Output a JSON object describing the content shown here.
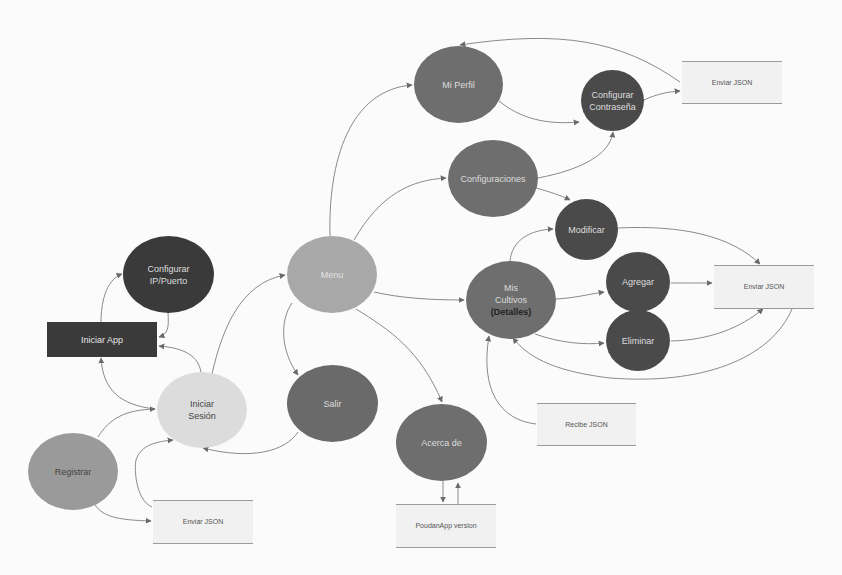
{
  "diagram": {
    "type": "navigation flow diagram",
    "colors": {
      "background": "#fbfbfb",
      "dark": "#3a3a3a",
      "medium_dark": "#555555",
      "medium": "#6e6e6e",
      "light_medium": "#9c9c9c",
      "light": "#d9d9d9",
      "store_fill": "#f1f1f1",
      "edge": "#8a8a8a"
    },
    "nodes": [
      {
        "id": "iniciar_app",
        "label": "Iniciar App",
        "shape": "rect",
        "x": 47,
        "y": 322,
        "w": 110,
        "h": 35,
        "fill": "#3a3a3a",
        "text": "#e8e8e8"
      },
      {
        "id": "configurar_ip",
        "label": "Configurar\nIP/Puerto",
        "shape": "ellipse",
        "x": 123,
        "y": 236,
        "w": 91,
        "h": 77,
        "fill": "#3a3a3a",
        "text": "#dddddd"
      },
      {
        "id": "menu",
        "label": "Menu",
        "shape": "ellipse",
        "x": 287,
        "y": 236,
        "w": 90,
        "h": 77,
        "fill": "#a8a8a8",
        "text": "#e4e4e4"
      },
      {
        "id": "iniciar_sesion",
        "label": "Iniciar\nSesión",
        "shape": "ellipse",
        "x": 157,
        "y": 372,
        "w": 90,
        "h": 76,
        "fill": "#dcdcdc",
        "text": "#444444"
      },
      {
        "id": "registrar",
        "label": "Registrar",
        "shape": "ellipse",
        "x": 28,
        "y": 433,
        "w": 90,
        "h": 77,
        "fill": "#9a9a9a",
        "text": "#444444"
      },
      {
        "id": "salir",
        "label": "Salir",
        "shape": "ellipse",
        "x": 287,
        "y": 365,
        "w": 91,
        "h": 77,
        "fill": "#6a6a6a",
        "text": "#dddddd"
      },
      {
        "id": "mi_perfil",
        "label": "Mi Perfil",
        "shape": "ellipse",
        "x": 414,
        "y": 46,
        "w": 89,
        "h": 77,
        "fill": "#6e6e6e",
        "text": "#dddddd"
      },
      {
        "id": "configurar_contrasena",
        "label": "Configurar\nContraseña",
        "shape": "ellipse",
        "x": 581,
        "y": 70,
        "w": 63,
        "h": 61,
        "fill": "#4a4a4a",
        "text": "#dddddd"
      },
      {
        "id": "configuraciones",
        "label": "Configuraciones",
        "shape": "ellipse",
        "x": 448,
        "y": 140,
        "w": 90,
        "h": 77,
        "fill": "#6e6e6e",
        "text": "#dddddd"
      },
      {
        "id": "modificar",
        "label": "Modificar",
        "shape": "ellipse",
        "x": 555,
        "y": 199,
        "w": 63,
        "h": 61,
        "fill": "#4a4a4a",
        "text": "#dddddd"
      },
      {
        "id": "mis_cultivos",
        "label": "Mis\nCultivos",
        "sublabel": "(Detalles)",
        "shape": "ellipse",
        "x": 466,
        "y": 261,
        "w": 90,
        "h": 78,
        "fill": "#6e6e6e",
        "text": "#dddddd"
      },
      {
        "id": "agregar",
        "label": "Agregar",
        "shape": "ellipse",
        "x": 606,
        "y": 252,
        "w": 64,
        "h": 60,
        "fill": "#4a4a4a",
        "text": "#dddddd"
      },
      {
        "id": "eliminar",
        "label": "Eliminar",
        "shape": "ellipse",
        "x": 606,
        "y": 310,
        "w": 64,
        "h": 61,
        "fill": "#4a4a4a",
        "text": "#dddddd"
      },
      {
        "id": "acerca_de",
        "label": "Acerca de",
        "shape": "ellipse",
        "x": 396,
        "y": 404,
        "w": 91,
        "h": 77,
        "fill": "#6e6e6e",
        "text": "#dddddd"
      },
      {
        "id": "enviar_json_top",
        "label": "Enviar JSON",
        "shape": "store",
        "x": 682,
        "y": 61,
        "w": 100,
        "h": 43
      },
      {
        "id": "enviar_json_right",
        "label": "Enviar JSON",
        "shape": "store",
        "x": 714,
        "y": 265,
        "w": 100,
        "h": 44
      },
      {
        "id": "recibe_json",
        "label": "Recibe JSON",
        "shape": "store",
        "x": 537,
        "y": 403,
        "w": 99,
        "h": 43
      },
      {
        "id": "enviar_json_bottom",
        "label": "Enviar JSON",
        "shape": "store",
        "x": 153,
        "y": 500,
        "w": 100,
        "h": 44
      },
      {
        "id": "poudan_version",
        "label": "PoudanApp version",
        "shape": "store",
        "x": 396,
        "y": 504,
        "w": 100,
        "h": 44
      }
    ],
    "edges": [
      {
        "from": "iniciar_app",
        "to": "configurar_ip",
        "path": "M101,322 C101,305 105,280 122,274"
      },
      {
        "from": "configurar_ip",
        "to": "iniciar_app",
        "path": "M168,313 C169,328 168,334 159,337"
      },
      {
        "from": "iniciar_sesion",
        "to": "iniciar_app",
        "path": "M201,372 C198,356 185,348 159,346"
      },
      {
        "from": "iniciar_sesion",
        "to": "iniciar_app",
        "path": "M155,409 C120,405 103,390 101,358"
      },
      {
        "from": "iniciar_sesion",
        "to": "menu",
        "path": "M212,374 C222,330 240,283 285,275"
      },
      {
        "from": "registrar",
        "to": "iniciar_sesion",
        "path": "M98,437 C110,418 125,410 155,409"
      },
      {
        "from": "registrar",
        "to": "enviar_json_bottom",
        "path": "M95,505 C103,516 115,520 151,521"
      },
      {
        "from": "enviar_json_bottom",
        "to": "iniciar_sesion",
        "path": "M152,507 C136,500 134,470 136,460 C140,448 150,442 173,440"
      },
      {
        "from": "salir",
        "to": "iniciar_sesion",
        "path": "M298,432 C285,452 250,460 203,448"
      },
      {
        "from": "menu",
        "to": "mi_perfil",
        "path": "M330,236 C328,160 350,90 412,85"
      },
      {
        "from": "menu",
        "to": "configuraciones",
        "path": "M354,240 C380,195 410,180 446,178"
      },
      {
        "from": "menu",
        "to": "mis_cultivos",
        "path": "M374,292 C400,298 430,300 464,300"
      },
      {
        "from": "menu",
        "to": "salir",
        "path": "M292,303 C280,320 280,350 298,375"
      },
      {
        "from": "menu",
        "to": "acerca_de",
        "path": "M356,309 C390,330 420,350 442,402"
      },
      {
        "from": "mi_perfil",
        "to": "configurar_contrasena",
        "path": "M499,101 C520,118 545,125 579,122"
      },
      {
        "from": "configurar_contrasena",
        "to": "enviar_json_top",
        "path": "M644,100 C655,95 665,92 680,91"
      },
      {
        "from": "enviar_json_top",
        "to": "mi_perfil",
        "path": "M680,82 C620,40 560,30 460,45"
      },
      {
        "from": "configuraciones",
        "to": "configurar_contrasena",
        "path": "M538,178 C580,170 610,155 613,132"
      },
      {
        "from": "configuraciones",
        "to": "modificar",
        "path": "M536,188 C550,192 560,195 570,200"
      },
      {
        "from": "mis_cultivos",
        "to": "modificar",
        "path": "M510,261 C512,240 530,230 553,229"
      },
      {
        "from": "mis_cultivos",
        "to": "agregar",
        "path": "M556,299 C575,298 590,294 604,292"
      },
      {
        "from": "mis_cultivos",
        "to": "eliminar",
        "path": "M535,334 C560,343 585,345 604,343"
      },
      {
        "from": "mis_cultivos_store",
        "to": "mis_cultivos",
        "path": "M536,424 C500,420 480,390 489,336"
      },
      {
        "from": "modificar",
        "to": "enviar_json_right",
        "path": "M618,228 C680,225 730,235 760,264"
      },
      {
        "from": "agregar",
        "to": "enviar_json_right",
        "path": "M671,283 C685,283 695,283 712,283"
      },
      {
        "from": "eliminar",
        "to": "enviar_json_right",
        "path": "M671,341 C710,340 740,328 763,309"
      },
      {
        "from": "enviar_json_right",
        "to": "mis_cultivos",
        "path": "M792,309 C770,360 700,385 610,378 C560,372 530,360 513,338"
      },
      {
        "from": "acerca_de",
        "to": "poudan_version",
        "path": "M443,481 L443,502"
      },
      {
        "from": "poudan_version",
        "to": "acerca_de",
        "path": "M458,504 L458,483"
      }
    ]
  }
}
